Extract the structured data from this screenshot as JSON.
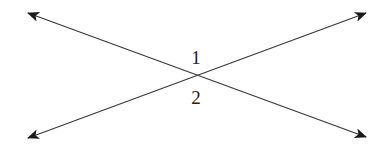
{
  "diagram": {
    "lines": [
      {
        "name": "line-a",
        "from": [
          28,
          13
        ],
        "to": [
          366,
          137
        ],
        "arrows": "both"
      },
      {
        "name": "line-b",
        "from": [
          28,
          138
        ],
        "to": [
          366,
          13
        ],
        "arrows": "both"
      }
    ],
    "intersection": [
      195,
      75
    ],
    "angle_labels": [
      {
        "text": "1",
        "x": 196,
        "y": 64
      },
      {
        "text": "2",
        "x": 196,
        "y": 104
      }
    ],
    "colors": {
      "line": "#3a3a3a",
      "arrow": "#1a1a1a",
      "label": "#222222",
      "background": "#ffffff"
    }
  }
}
